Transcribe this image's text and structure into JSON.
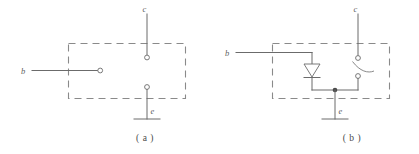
{
  "figure": {
    "type": "electrical-schematic",
    "stroke_color": "#6b6b6b",
    "dash_color": "#8a8a8a",
    "background_color": "#ffffff"
  },
  "panels": [
    {
      "id": "a",
      "caption": "( a )",
      "terminals": [
        {
          "name": "base-terminal",
          "label": "b",
          "position": "left"
        },
        {
          "name": "collector-terminal",
          "label": "c",
          "position": "top"
        },
        {
          "name": "emitter-terminal",
          "label": "e",
          "position": "bottom"
        }
      ],
      "components": [],
      "notes": "Open dashed enclosure: base lead ends in an open circle inside the box; collector and emitter leads end in open circles; emitter lead terminates in a short horizontal bar."
    },
    {
      "id": "b",
      "caption": "( b )",
      "terminals": [
        {
          "name": "base-terminal",
          "label": "b",
          "position": "left"
        },
        {
          "name": "collector-terminal",
          "label": "c",
          "position": "top"
        },
        {
          "name": "emitter-terminal",
          "label": "e",
          "position": "bottom"
        }
      ],
      "components": [
        {
          "name": "diode",
          "symbol": "diode-down",
          "between": "base",
          "and": "emitter-node"
        },
        {
          "name": "switch",
          "symbol": "switch-open",
          "between": "collector",
          "and": "emitter-node"
        }
      ],
      "notes": "Dashed enclosure contains a downward-pointing diode from base branch to the common emitter node and an open switch from the collector branch to the same node; a solid junction dot marks the emitter node."
    }
  ],
  "labels": {
    "base": "b",
    "collector": "c",
    "emitter": "e",
    "caption_a": "( a )",
    "caption_b": "( b )"
  }
}
